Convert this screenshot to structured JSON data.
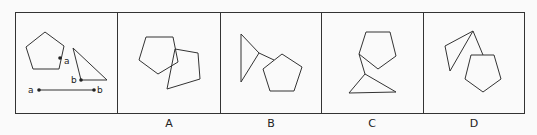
{
  "puzzle": {
    "type": "spatial-reasoning",
    "question_panel": {
      "description": "Pentagon with point a, right triangle with point b, and a segment a—b indicating the two points are joined",
      "point_labels": [
        "a",
        "b",
        "a",
        "b"
      ]
    },
    "options": [
      {
        "label": "A"
      },
      {
        "label": "B"
      },
      {
        "label": "C"
      },
      {
        "label": "D"
      }
    ]
  },
  "style": {
    "stroke": "#333333",
    "background": "#fafafa"
  }
}
